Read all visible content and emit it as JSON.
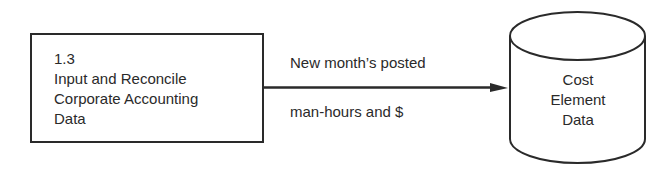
{
  "process": {
    "number": "1.3",
    "lines": [
      "Input and Reconcile",
      "Corporate Accounting",
      "Data"
    ]
  },
  "flow": {
    "label_top": "New month’s posted",
    "label_bottom": "man-hours and $"
  },
  "datastore": {
    "lines": [
      "Cost",
      "Element",
      "Data"
    ]
  },
  "colors": {
    "stroke": "#2a2a2a",
    "background": "#ffffff"
  }
}
